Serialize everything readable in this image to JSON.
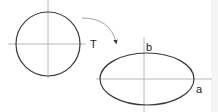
{
  "diagram": {
    "colors": {
      "background": "#ffffff",
      "shape_stroke": "#3a3a3a",
      "axis_stroke": "#b8b8b8",
      "arrow_stroke": "#9a9a9a",
      "label": "#222222",
      "edge_strip": "#f5f5f5"
    },
    "source_shape": {
      "type": "circle",
      "cx": 48,
      "cy": 44,
      "r": 32
    },
    "source_axes": {
      "horizontal": {
        "x1": 8,
        "y1": 44,
        "x2": 86,
        "y2": 44
      },
      "vertical": {
        "x1": 48,
        "y1": 0,
        "x2": 48,
        "y2": 78
      }
    },
    "transform_arrow": {
      "label": "T",
      "path": "M 82 18 Q 110 18 116 42"
    },
    "target_shape": {
      "type": "ellipse",
      "cx": 147,
      "cy": 79,
      "rx": 47,
      "ry": 26
    },
    "target_axes": {
      "horizontal": {
        "x1": 96,
        "y1": 79,
        "x2": 212,
        "y2": 79
      },
      "vertical": {
        "x1": 144,
        "y1": 37,
        "x2": 144,
        "y2": 112
      }
    },
    "labels": {
      "transform": "T",
      "semi_minor": "b",
      "semi_major": "a"
    }
  }
}
